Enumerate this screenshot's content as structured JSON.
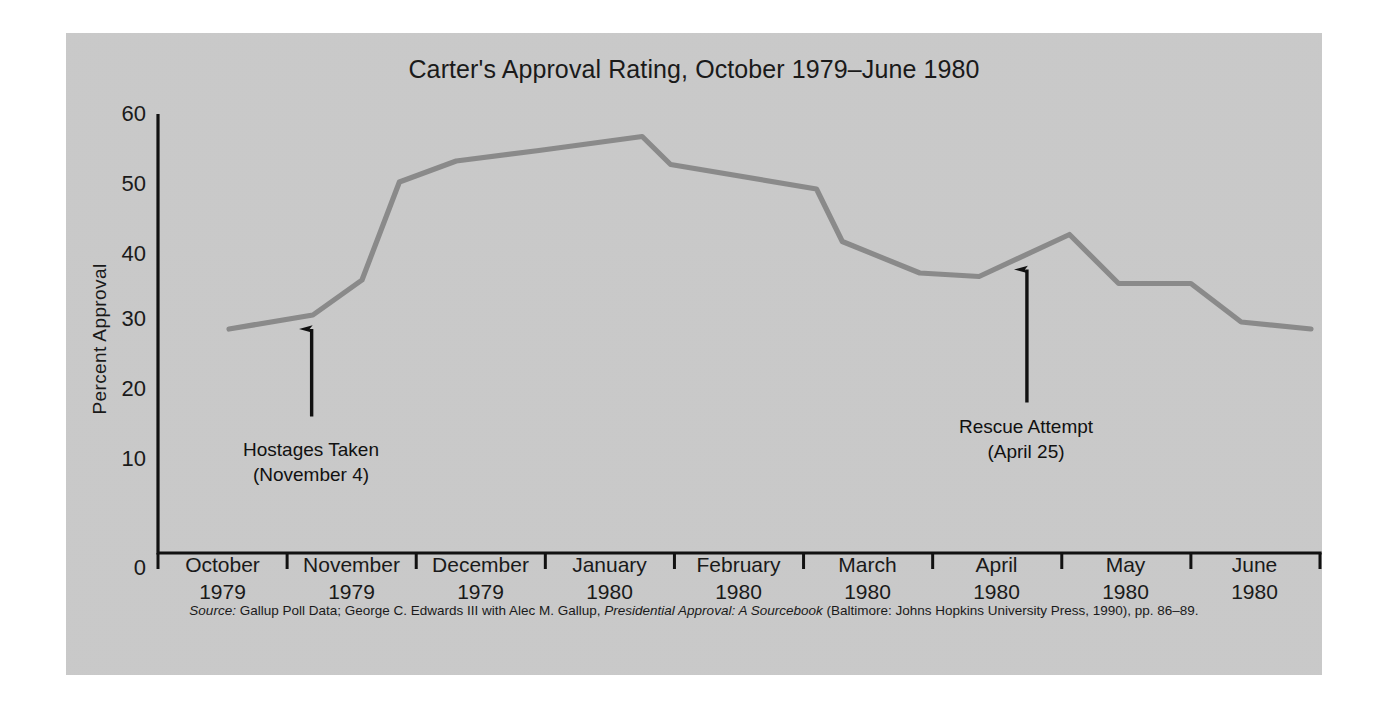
{
  "figure": {
    "background_color": "#cccccc",
    "line_color": "#8a8a8a",
    "axis_color": "#111111",
    "text_color": "#1a1a1a"
  },
  "chart_data": {
    "type": "line",
    "title": "Carter's Approval Rating, October 1979–June 1980",
    "xlabel": "",
    "ylabel": "Percent Approval",
    "ylim": [
      0,
      62
    ],
    "yticks": [
      0,
      10,
      20,
      30,
      40,
      50,
      60
    ],
    "grid": false,
    "legend": "none",
    "categories": [
      "October 1979",
      "November 1979",
      "December 1979",
      "January 1980",
      "February 1980",
      "March 1980",
      "April 1980",
      "May 1980",
      "June 1980"
    ],
    "x_tick_labels": [
      {
        "month": "October",
        "year": "1979"
      },
      {
        "month": "November",
        "year": "1979"
      },
      {
        "month": "December",
        "year": "1979"
      },
      {
        "month": "January",
        "year": "1980"
      },
      {
        "month": "February",
        "year": "1980"
      },
      {
        "month": "March",
        "year": "1980"
      },
      {
        "month": "April",
        "year": "1980"
      },
      {
        "month": "May",
        "year": "1980"
      },
      {
        "month": "June",
        "year": "1980"
      }
    ],
    "series": [
      {
        "name": "Percent Approval",
        "points": [
          {
            "x": 0.55,
            "y": 32.0
          },
          {
            "x": 1.2,
            "y": 34.0
          },
          {
            "x": 1.58,
            "y": 39.0
          },
          {
            "x": 1.87,
            "y": 53.0
          },
          {
            "x": 2.31,
            "y": 56.0
          },
          {
            "x": 2.95,
            "y": 57.5
          },
          {
            "x": 3.75,
            "y": 59.5
          },
          {
            "x": 3.97,
            "y": 55.5
          },
          {
            "x": 5.1,
            "y": 52.0
          },
          {
            "x": 5.3,
            "y": 44.5
          },
          {
            "x": 5.9,
            "y": 40.0
          },
          {
            "x": 6.36,
            "y": 39.5
          },
          {
            "x": 7.06,
            "y": 45.5
          },
          {
            "x": 7.44,
            "y": 38.5
          },
          {
            "x": 8.0,
            "y": 38.5
          },
          {
            "x": 8.39,
            "y": 33.0
          },
          {
            "x": 8.93,
            "y": 32.0
          }
        ]
      }
    ],
    "annotations": [
      {
        "id": "hostages-taken",
        "line1": "Hostages Taken",
        "line2": "(November 4)",
        "x": 1.19,
        "arrow_from_y": 19.5,
        "arrow_to_y": 32.0
      },
      {
        "id": "rescue-attempt",
        "line1": "Rescue Attempt",
        "line2": "(April 25)",
        "x": 6.73,
        "arrow_from_y": 21.5,
        "arrow_to_y": 40.5
      }
    ]
  },
  "source": {
    "label": "Source:",
    "part1": " Gallup Poll Data; George C. Edwards III with Alec M. Gallup, ",
    "italic_title": "Presidential Approval: A Sourcebook",
    "part2": " (Baltimore: Johns Hopkins University Press, 1990), pp. 86–89."
  }
}
